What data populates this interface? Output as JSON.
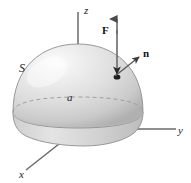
{
  "figure": {
    "background_color": "#ffffff",
    "width": 191,
    "height": 183
  },
  "axes": {
    "z": {
      "label": "z",
      "color": "#555555"
    },
    "y": {
      "label": "y",
      "color": "#555555"
    },
    "x": {
      "label": "x",
      "color": "#555555"
    }
  },
  "surface": {
    "label": "S",
    "radius_label": "a",
    "shape": "hemisphere",
    "fill_light": "#f2f2f2",
    "fill_mid": "#d8d8d8",
    "fill_dark": "#b4b4b4",
    "outline_color": "#8a8a8a",
    "base_dashed_color": "#9a9a9a"
  },
  "vectors": {
    "force": {
      "label": "F",
      "direction": "up",
      "color": "#555555"
    },
    "normal": {
      "label": "n",
      "direction": "outward-upper-right",
      "color": "#555555"
    }
  }
}
